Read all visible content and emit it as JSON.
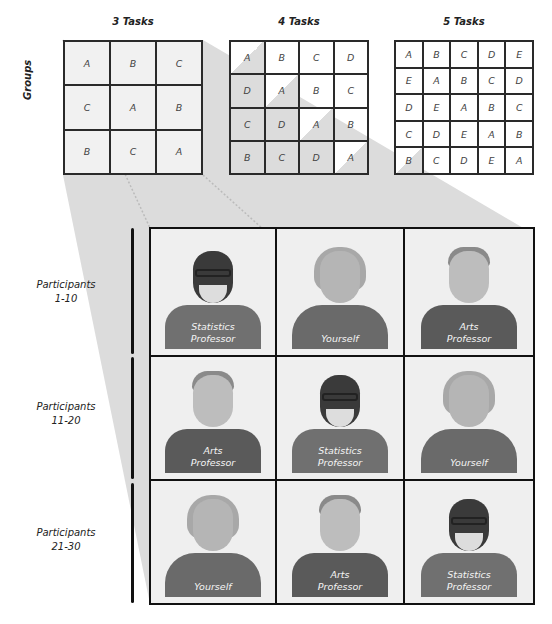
{
  "diagram": {
    "groups_label": "Groups",
    "latin_squares": [
      {
        "title": "3 Tasks",
        "size": 3,
        "cells": [
          [
            "A",
            "B",
            "C"
          ],
          [
            "C",
            "A",
            "B"
          ],
          [
            "B",
            "C",
            "A"
          ]
        ]
      },
      {
        "title": "4 Tasks",
        "size": 4,
        "cells": [
          [
            "A",
            "B",
            "C",
            "D"
          ],
          [
            "D",
            "A",
            "B",
            "C"
          ],
          [
            "C",
            "D",
            "A",
            "B"
          ],
          [
            "B",
            "C",
            "D",
            "A"
          ]
        ]
      },
      {
        "title": "5 Tasks",
        "size": 5,
        "cells": [
          [
            "A",
            "B",
            "C",
            "D",
            "E"
          ],
          [
            "E",
            "A",
            "B",
            "C",
            "D"
          ],
          [
            "D",
            "E",
            "A",
            "B",
            "C"
          ],
          [
            "C",
            "D",
            "E",
            "A",
            "B"
          ],
          [
            "B",
            "C",
            "D",
            "E",
            "A"
          ]
        ]
      }
    ],
    "participant_rows": [
      {
        "label_line1": "Participants",
        "label_line2": "1-10",
        "cells": [
          {
            "role": "statistics-professor",
            "label_line1": "Statistics",
            "label_line2": "Professor"
          },
          {
            "role": "yourself",
            "label_line1": "",
            "label_line2": "Yourself"
          },
          {
            "role": "arts-professor",
            "label_line1": "Arts",
            "label_line2": "Professor"
          }
        ]
      },
      {
        "label_line1": "Participants",
        "label_line2": "11-20",
        "cells": [
          {
            "role": "arts-professor",
            "label_line1": "Arts",
            "label_line2": "Professor"
          },
          {
            "role": "statistics-professor",
            "label_line1": "Statistics",
            "label_line2": "Professor"
          },
          {
            "role": "yourself",
            "label_line1": "",
            "label_line2": "Yourself"
          }
        ]
      },
      {
        "label_line1": "Participants",
        "label_line2": "21-30",
        "cells": [
          {
            "role": "yourself",
            "label_line1": "",
            "label_line2": "Yourself"
          },
          {
            "role": "arts-professor",
            "label_line1": "Arts",
            "label_line2": "Professor"
          },
          {
            "role": "statistics-professor",
            "label_line1": "Statistics",
            "label_line2": "Professor"
          }
        ]
      }
    ],
    "colors": {
      "projection_fill": "#dcdcdc",
      "grid_line": "#2a2a2a",
      "cell_bg": "#efefef"
    }
  }
}
